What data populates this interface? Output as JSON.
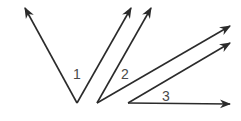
{
  "diagram": {
    "stroke_color": "#2b2b2b",
    "label_color": "#4a4a4a",
    "angles": [
      {
        "label": "1",
        "vertex": [
          77,
          103
        ],
        "rays": [
          [
            25,
            8
          ],
          [
            131,
            8
          ]
        ],
        "label_pos": [
          73,
          79
        ]
      },
      {
        "label": "2",
        "vertex": [
          97,
          103
        ],
        "rays": [
          [
            151,
            8
          ],
          [
            230,
            26
          ]
        ],
        "label_pos": [
          121,
          79
        ]
      },
      {
        "label": "3",
        "vertex": [
          128,
          103
        ],
        "rays": [
          [
            230,
            43
          ],
          [
            230,
            104
          ]
        ],
        "label_pos": [
          162,
          101
        ]
      }
    ]
  }
}
